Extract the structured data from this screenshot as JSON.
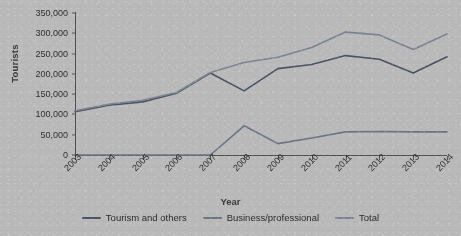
{
  "chart_data": {
    "type": "line",
    "title": "",
    "xlabel": "Year",
    "ylabel": "Tourists",
    "categories": [
      "2003",
      "2004",
      "2005",
      "2006",
      "2007",
      "2008",
      "2009",
      "2010",
      "2011",
      "2012",
      "2013",
      "2014"
    ],
    "ylim": [
      0,
      350000
    ],
    "yticks": [
      0,
      50000,
      100000,
      150000,
      200000,
      250000,
      300000,
      350000
    ],
    "ytick_labels": [
      "0",
      "50,000",
      "100,000",
      "150,000",
      "200,000",
      "250,000",
      "300,000",
      "350,000"
    ],
    "grid": false,
    "legend_position": "bottom",
    "series": [
      {
        "name": "Tourism and others",
        "color": "#4a5363",
        "values": [
          107000,
          123000,
          131000,
          152000,
          202000,
          158000,
          213000,
          223000,
          245000,
          236000,
          202000,
          242000
        ]
      },
      {
        "name": "Business/professional",
        "color": "#6b7484",
        "values": [
          0,
          0,
          0,
          0,
          0,
          72000,
          28000,
          42000,
          57000,
          58000,
          57000,
          57000
        ]
      },
      {
        "name": "Total",
        "color": "#7b8493",
        "values": [
          109000,
          125000,
          135000,
          154000,
          203000,
          228000,
          241000,
          265000,
          303000,
          296000,
          260000,
          298000
        ]
      }
    ]
  },
  "axis": {
    "x_title": "Year",
    "y_title": "Tourists"
  },
  "legend": {
    "items": [
      {
        "label": "Tourism and others",
        "color": "#4a5363"
      },
      {
        "label": "Business/professional",
        "color": "#6b7484"
      },
      {
        "label": "Total",
        "color": "#7b8493"
      }
    ]
  }
}
